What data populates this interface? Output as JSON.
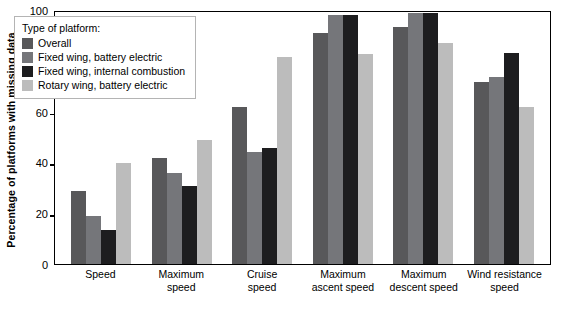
{
  "chart_data": {
    "type": "bar",
    "title": "",
    "xlabel": "",
    "ylabel": "Percentage of platforms with missing data",
    "ylim": [
      0,
      100
    ],
    "yticks": [
      0,
      20,
      40,
      60,
      80,
      100
    ],
    "grid": false,
    "legend_position": "top-left",
    "legend_title": "Type of platform:",
    "categories": [
      "Speed",
      "Maximum\nspeed",
      "Cruise\nspeed",
      "Maximum\nascent speed",
      "Maximum\ndescent speed",
      "Wind resistance\nspeed"
    ],
    "series": [
      {
        "name": "Overall",
        "color": "#58585a",
        "values": [
          29,
          42,
          62,
          91.5,
          94,
          72
        ]
      },
      {
        "name": "Fixed wing, battery electric",
        "color": "#75767a",
        "values": [
          19,
          36,
          44.5,
          98.5,
          99.5,
          74
        ]
      },
      {
        "name": "Fixed wing, internal combustion",
        "color": "#1d1d1f",
        "values": [
          13.5,
          31,
          46,
          98.5,
          99.5,
          83.5
        ]
      },
      {
        "name": "Rotary wing, battery electric",
        "color": "#bcbcbc",
        "values": [
          40,
          49,
          82,
          83,
          87.5,
          62
        ]
      }
    ]
  },
  "axis": {
    "y_title": "Percentage of platforms with missing data",
    "y_tick_labels": [
      "0",
      "20",
      "40",
      "60",
      "80",
      "100"
    ]
  },
  "colors": {
    "axis": "#000000",
    "legend_border": "#b4b4b4",
    "background": "#ffffff"
  }
}
